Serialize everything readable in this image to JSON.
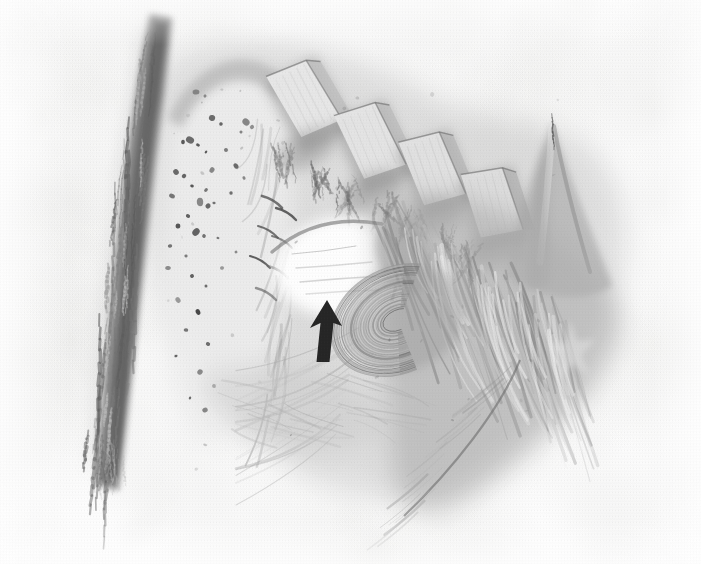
{
  "figure": {
    "domain": "Natural-Image",
    "kind": "medical-anatomical-illustration",
    "medium": "grayscale ink-and-wash drawing, halftone printed",
    "description": "Monochrome pen-and-wash anatomical drawing of a dissected specimen. A dark vertical band runs down the left third. A pale speckled tissue mass occupies the upper-left centre. Four pale rectangular tooth-like blocks descend diagonally across the top right. A bright white cavity sits at centre, indicated by a solid black arrow pointing upward. Striated fibrous tissue sweeps down to the lower right.",
    "canvas": {
      "width": 701,
      "height": 564
    },
    "background_color": "#fdfdfd",
    "ink_color": "#4a4a4a",
    "arrow_color": "#0d0d0d",
    "highlight_color": "#ffffff",
    "midtone_color": "#9a9a9a",
    "shadow_color": "#5a5a5a"
  },
  "annotations": {
    "arrow": {
      "name": "pointer-arrow",
      "shape": "solid filled arrow",
      "direction": "up",
      "color": "#0d0d0d",
      "tip": {
        "x": 327,
        "y": 300
      },
      "base": {
        "x": 327,
        "y": 362
      },
      "shaft_width": 11,
      "head_width": 30,
      "head_height": 26,
      "points_to": "bright white cavity / lesion at centre of specimen"
    }
  },
  "regions": [
    {
      "name": "left-dark-band",
      "label": "Dark vertical band (left margin structure)",
      "tone": "#595959",
      "bbox": [
        82,
        14,
        78,
        470
      ]
    },
    {
      "name": "speckled-tissue-mass",
      "label": "Pale speckled tissue mass with dark puncta",
      "tone": "#ececec",
      "bbox": [
        150,
        55,
        160,
        340
      ]
    },
    {
      "name": "tooth-block-1",
      "label": "Pale rectangular block 1",
      "tone": "#dcdcdc",
      "bbox": [
        275,
        60,
        60,
        80
      ]
    },
    {
      "name": "tooth-block-2",
      "label": "Pale rectangular block 2",
      "tone": "#d8d8d8",
      "bbox": [
        340,
        105,
        60,
        80
      ]
    },
    {
      "name": "tooth-block-3",
      "label": "Pale rectangular block 3",
      "tone": "#d4d4d4",
      "bbox": [
        400,
        130,
        58,
        80
      ]
    },
    {
      "name": "tooth-block-4",
      "label": "Pale rectangular block 4",
      "tone": "#d0d0d0",
      "bbox": [
        460,
        165,
        58,
        76
      ]
    },
    {
      "name": "central-white-cavity",
      "label": "Bright white cavity indicated by the arrow",
      "tone": "#ffffff",
      "bbox": [
        270,
        225,
        130,
        80
      ]
    },
    {
      "name": "striated-fibrous-mass",
      "label": "Striated fibrous tissue sweeping to lower right",
      "tone": "#a8a8a8",
      "bbox": [
        360,
        200,
        290,
        320
      ]
    },
    {
      "name": "concentric-whorl",
      "label": "Concentric curved laminations",
      "tone": "#8f8f8f",
      "bbox": [
        355,
        255,
        120,
        110
      ]
    },
    {
      "name": "right-peak",
      "label": "Tall pointed ridge at upper right",
      "tone": "#b4b4b4",
      "bbox": [
        540,
        120,
        70,
        140
      ]
    }
  ]
}
